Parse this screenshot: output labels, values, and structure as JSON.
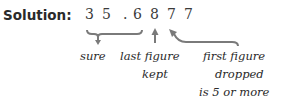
{
  "label": "Solution:",
  "number": {
    "digits": [
      "3",
      "5",
      ".",
      "6",
      "8",
      "7",
      "7"
    ]
  },
  "annotations": {
    "sure": "sure",
    "last_kept_line1": "last figure",
    "last_kept_line2": "kept",
    "first_dropped_line1": "first figure",
    "first_dropped_line2": "dropped",
    "first_dropped_line3": "is 5 or more"
  },
  "colors": {
    "text": "#2a2a2a",
    "arrow": "#7a7a7a"
  }
}
